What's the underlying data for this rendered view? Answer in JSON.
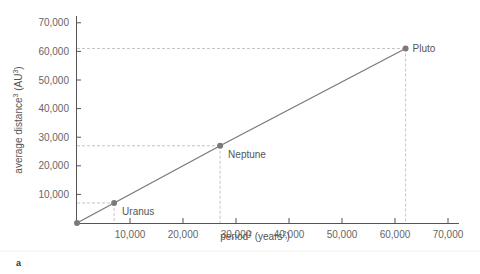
{
  "chart_data": {
    "type": "line",
    "title": "",
    "panel_label": "a",
    "xlabel": "period",
    "xlabel_sup": "2",
    "xlabel_unit": " (years",
    "xlabel_unit_sup": "2",
    "xlabel_close": ")",
    "ylabel": "average distance",
    "ylabel_sup": "3",
    "ylabel_unit": " (AU",
    "ylabel_unit_sup": "3",
    "ylabel_close": ")",
    "xlim": [
      0,
      72000
    ],
    "ylim": [
      0,
      72000
    ],
    "x_ticks": [
      10000,
      20000,
      30000,
      40000,
      50000,
      60000,
      70000
    ],
    "x_tick_labels": [
      "10,000",
      "20,000",
      "30,000",
      "40,000",
      "50,000",
      "60,000",
      "70,000"
    ],
    "y_ticks": [
      10000,
      20000,
      30000,
      40000,
      50000,
      60000,
      70000
    ],
    "y_tick_labels": [
      "10,000",
      "20,000",
      "30,000",
      "40,000",
      "50,000",
      "60,000",
      "70,000"
    ],
    "grid": false,
    "legend": null,
    "series": [
      {
        "name": "Outer planets (P² vs a³)",
        "points": [
          {
            "label": "",
            "x": 0,
            "y": 0
          },
          {
            "label": "Uranus",
            "x": 7000,
            "y": 7000
          },
          {
            "label": "Neptune",
            "x": 27000,
            "y": 27000
          },
          {
            "label": "Pluto",
            "x": 62000,
            "y": 61000
          }
        ]
      }
    ],
    "colors": {
      "line": "#7a7a7a",
      "point": "#7a7a7a",
      "guide": "#b5b5b5",
      "axis": "#555555"
    }
  }
}
